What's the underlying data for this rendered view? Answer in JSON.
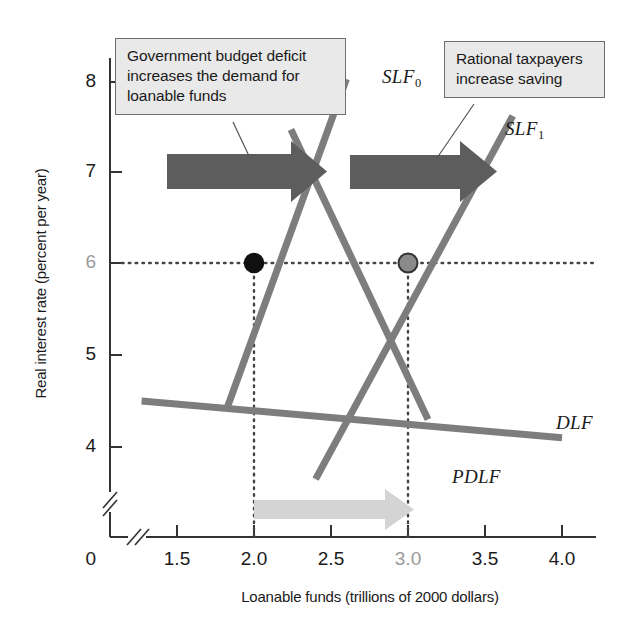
{
  "chart_data": {
    "type": "line",
    "title": "",
    "xlabel": "Loanable funds (trillions of 2000 dollars)",
    "ylabel": "Real interest rate (percent per year)",
    "xlim": [
      1.15,
      4.25
    ],
    "ylim": [
      3.3,
      8.55
    ],
    "x_ticks": [
      "1.5",
      "2.0",
      "2.5",
      "3.0",
      "3.5",
      "4.0"
    ],
    "x_tick_values": [
      1.5,
      2.0,
      2.5,
      3.0,
      3.5,
      4.0
    ],
    "y_ticks": [
      "8",
      "7",
      "6",
      "5",
      "4"
    ],
    "y_tick_values": [
      8,
      7,
      6,
      5,
      4
    ],
    "origin_label": "0",
    "grid": false,
    "axis_breaks": [
      "x-axis-break",
      "y-axis-break"
    ],
    "series": [
      {
        "name": "DLF",
        "label": "DLF",
        "description": "Demand for loanable funds, downward sloping",
        "color": "#7d7d7d",
        "points": [
          [
            1.27,
            4.5
          ],
          [
            4.0,
            4.1
          ]
        ]
      },
      {
        "name": "PDLF",
        "label": "PDLF",
        "description": "Private demand for loanable funds, downward sloping, left of DLF",
        "color": "#7d7d7d",
        "points": [
          [
            2.24,
            7.45
          ],
          [
            3.13,
            4.3
          ]
        ]
      },
      {
        "name": "SLF0",
        "label": "SLF",
        "sub": "0",
        "description": "Original supply of loanable funds, upward sloping",
        "color": "#7d7d7d",
        "points": [
          [
            1.82,
            4.4
          ],
          [
            2.6,
            8.0
          ]
        ]
      },
      {
        "name": "SLF1",
        "label": "SLF",
        "sub": "1",
        "description": "New supply of loanable funds after rational taxpayers save more",
        "color": "#7d7d7d",
        "points": [
          [
            2.4,
            3.65
          ],
          [
            3.68,
            7.6
          ]
        ]
      }
    ],
    "equilibria": [
      {
        "name": "original-equilibrium",
        "x": 2.0,
        "y": 6.0,
        "fill": "#111111",
        "stroke": "#111111",
        "label": "2.0, 6"
      },
      {
        "name": "new-equilibrium",
        "x": 3.0,
        "y": 6.0,
        "fill": "#8a8a8a",
        "stroke": "#333333",
        "label": "3.0, 6"
      }
    ],
    "guide_lines": [
      {
        "name": "horizontal-6-percent",
        "type": "horizontal",
        "value": 6,
        "from_x": 1.15,
        "to_x": 4.25,
        "style": "dotted"
      },
      {
        "name": "vertical-2-trillion",
        "type": "vertical",
        "value": 2.0,
        "from_y": 6,
        "to_y": 3.3,
        "style": "dotted"
      },
      {
        "name": "vertical-3-trillion",
        "type": "vertical",
        "value": 3.0,
        "from_y": 6,
        "to_y": 3.3,
        "style": "dotted"
      }
    ],
    "shift_arrows": [
      {
        "name": "demand-shift-arrow",
        "color": "#5d5d5d",
        "direction": "right",
        "from_x": 1.63,
        "to_x": 2.22,
        "y": 7.25,
        "meaning": "Demand for loanable funds increases"
      },
      {
        "name": "supply-shift-arrow",
        "color": "#5d5d5d",
        "direction": "right",
        "from_x": 2.47,
        "to_x": 3.2,
        "y": 7.2,
        "meaning": "Supply of loanable funds increases"
      },
      {
        "name": "quantity-change-arrow",
        "color": "#d4d4d4",
        "direction": "right",
        "from_x": 2.0,
        "to_x": 3.0,
        "y": 3.65,
        "meaning": "Quantity of loanable funds increases from 2.0 to 3.0"
      }
    ],
    "annotations": [
      {
        "name": "callout-deficit",
        "text": "Government budget deficit increases the demand for loanable funds",
        "points_to": "demand-shift-arrow"
      },
      {
        "name": "callout-saving",
        "text": "Rational taxpayers increase saving",
        "points_to": "supply-shift-arrow"
      }
    ],
    "colors": {
      "curve": "#7d7d7d",
      "axis": "#333333",
      "dark_arrow": "#5d5d5d",
      "light_arrow": "#d4d4d4",
      "callout_fill": "#e9e9e9",
      "callout_border": "#6e6e6e",
      "text": "#1a1a1a",
      "muted_text": "#9a9a9a"
    }
  },
  "labels": {
    "y_axis_title": "Real interest rate (percent per year)",
    "x_axis_title": "Loanable funds (trillions of 2000 dollars)",
    "origin": "0",
    "y_tick_8": "8",
    "y_tick_7": "7",
    "y_tick_6": "6",
    "y_tick_5": "5",
    "y_tick_4": "4",
    "x_tick_15": "1.5",
    "x_tick_20": "2.0",
    "x_tick_25": "2.5",
    "x_tick_30": "3.0",
    "x_tick_35": "3.5",
    "x_tick_40": "4.0",
    "slf0": "SLF",
    "slf0_sub": "0",
    "slf1": "SLF",
    "slf1_sub": "1",
    "dlf": "DLF",
    "pdlf": "PDLF",
    "callout_deficit": "Government budget deficit increases the demand for loanable funds",
    "callout_saving": "Rational taxpayers increase saving"
  }
}
